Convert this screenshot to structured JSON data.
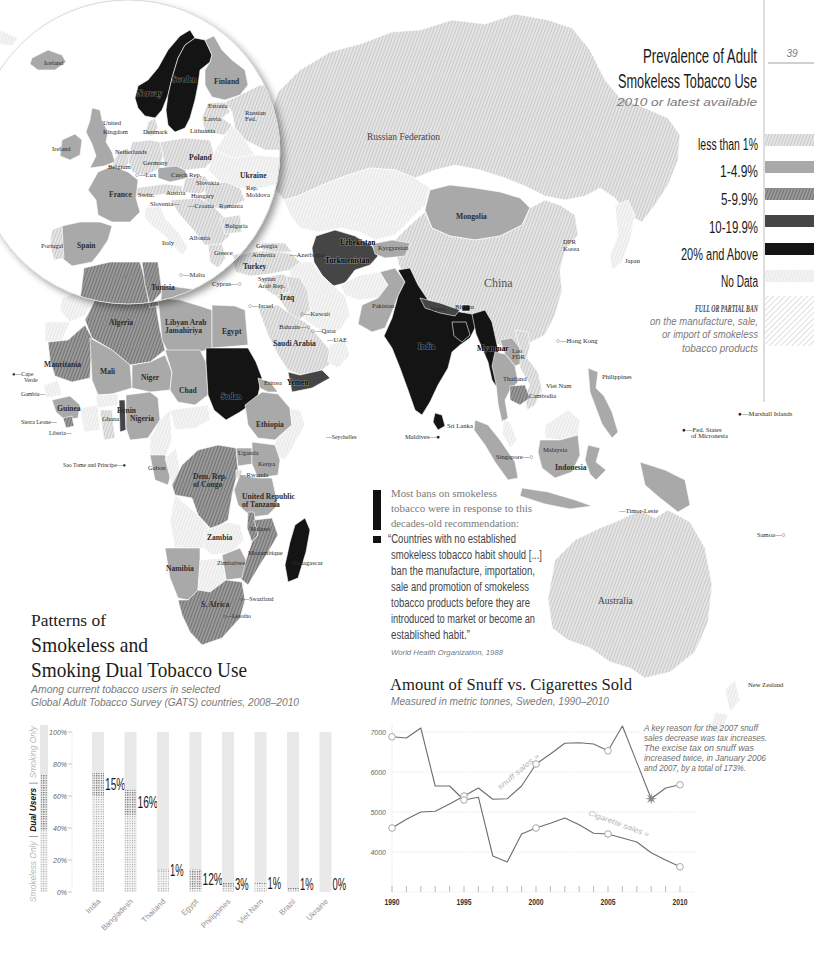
{
  "page": {
    "number": "39"
  },
  "map_title": {
    "line1": "Prevalence of Adult",
    "line2": "Smokeless Tobacco Use",
    "subtitle": "2010 or latest available"
  },
  "legend": {
    "items": [
      {
        "key": "lt1",
        "label": "less than 1%",
        "color": "#e2e2e2",
        "hatched": true
      },
      {
        "key": "1to5",
        "label": "1-4.9%",
        "color": "#a9a9a9",
        "hatched": false
      },
      {
        "key": "5to10",
        "label": "5-9.9%",
        "color": "#8c8c8c",
        "hatched": true
      },
      {
        "key": "10to20",
        "label": "10-19.9%",
        "color": "#454545",
        "hatched": false
      },
      {
        "key": "20plus",
        "label": "20% and Above",
        "color": "#141414",
        "hatched": false
      },
      {
        "key": "nodata",
        "label": "No Data",
        "color": "#f0f0f0",
        "hatched": true
      }
    ],
    "ban": {
      "title": "FULL OR PARTIAL BAN",
      "lines": [
        "on the manufacture, sale,",
        "or import of smokeless",
        "tobacco products"
      ]
    }
  },
  "map": {
    "countries": {
      "greenland": "nodata",
      "russia": "lt1",
      "kazakhstan": "nodata",
      "mongolia": "1to5",
      "china": "lt1",
      "japan": "nodata",
      "uzbekistan_turkmenistan": "10to20",
      "kyrgyzstan": "1to5",
      "afghanistan": "nodata",
      "iran": "nodata",
      "pakistan": "1to5",
      "india": "20plus",
      "nepal": "10to20",
      "bhutan": "20plus",
      "bangladesh": "20plus",
      "myanmar": "20plus",
      "lao_pdr": "1to5",
      "thailand": "1to5",
      "viet_nam": "lt1",
      "cambodia": "5to10",
      "malaysia_peninsula": "nodata",
      "sumatra": "1to5",
      "malaysia_borneo": "nodata",
      "kalimantan": "1to5",
      "java": "1to5",
      "sulawesi": "1to5",
      "papua": "1to5",
      "philippines": "1to5",
      "sri_lanka": "20plus",
      "turkey": "lt1",
      "caucasus": "lt1",
      "syria": "lt1",
      "iraq": "lt1",
      "saudi_arabia": "lt1",
      "yemen": "10to20",
      "oman": "nodata",
      "morocco": "nodata",
      "western_sahara": "nodata",
      "algeria": "5to10",
      "tunisia": "5to10",
      "libya": "1to5",
      "egypt": "1to5",
      "mauritania": "5to10",
      "mali": "1to5",
      "niger": "1to5",
      "chad": "1to5",
      "sudan": "20plus",
      "eritrea": "1to5",
      "ethiopia": "1to5",
      "somalia": "nodata",
      "senegal_gambia": "nodata",
      "guinea": "1to5",
      "sierra_leone": "5to10",
      "cote_divoire": "nodata",
      "ghana": "lt1",
      "benin": "10to20",
      "burkina_faso": "nodata",
      "nigeria": "1to5",
      "cameroon": "nodata",
      "central_african_rep": "nodata",
      "gabon": "1to5",
      "congo": "nodata",
      "dem_rep_congo": "5to10",
      "uganda": "1to5",
      "kenya": "1to5",
      "rwanda": "lt1",
      "tanzania": "1to5",
      "angola": "nodata",
      "zambia": "nodata",
      "malawi": "5to10",
      "mozambique": "5to10",
      "zimbabwe": "1to5",
      "namibia": "1to5",
      "botswana": "nodata",
      "south_africa": "5to10",
      "madagascar": "20plus",
      "australia": "lt1",
      "new_zealand": "nodata",
      "eu_iceland": "1to5",
      "eu_norway": "20plus",
      "eu_sweden": "20plus",
      "eu_finland": "1to5",
      "eu_baltics": "lt1",
      "eu_russia": "lt1",
      "eu_belarus": "nodata",
      "eu_uk": "1to5",
      "eu_ireland": "1to5",
      "eu_denmark": "lt1",
      "eu_benelux": "lt1",
      "eu_germany": "lt1",
      "eu_poland": "lt1",
      "eu_czech": "1to5",
      "eu_slovakia_hungary": "lt1",
      "eu_alps": "lt1",
      "eu_ukraine": "nodata",
      "eu_romania_moldova": "lt1",
      "eu_france": "1to5",
      "eu_spain": "1to5",
      "eu_portugal": "lt1",
      "eu_italy": "nodata",
      "eu_balkans": "lt1",
      "eu_greece": "lt1",
      "eu_bulgaria": "lt1",
      "eu_turkey": "lt1",
      "eu_algeria": "5to10",
      "eu_tunisia": "5to10",
      "eu_libya": "1to5"
    },
    "inset_labels": [
      {
        "t": "Iceland",
        "x": 44,
        "y": 65
      },
      {
        "t": "Sweden",
        "x": 172,
        "y": 82,
        "s": "dark"
      },
      {
        "t": "Norway",
        "x": 137,
        "y": 96,
        "s": "dark"
      },
      {
        "t": "Finland",
        "x": 214,
        "y": 84,
        "s": "md"
      },
      {
        "t": "Estonia",
        "x": 208,
        "y": 108
      },
      {
        "t": "Latvia",
        "x": 204,
        "y": 121
      },
      {
        "t": "Lithuania",
        "x": 190,
        "y": 133
      },
      {
        "t": "Russian",
        "x": 245,
        "y": 115
      },
      {
        "t": "Fed.",
        "x": 245,
        "y": 121
      },
      {
        "t": "United",
        "x": 103,
        "y": 125
      },
      {
        "t": "Kingdom",
        "x": 103,
        "y": 134
      },
      {
        "t": "Denmark",
        "x": 143,
        "y": 134
      },
      {
        "t": "Ireland",
        "x": 52,
        "y": 151
      },
      {
        "t": "Netherlands",
        "x": 115,
        "y": 154
      },
      {
        "t": "Germany",
        "x": 143,
        "y": 165
      },
      {
        "t": "Poland",
        "x": 189,
        "y": 160,
        "s": "md"
      },
      {
        "t": "Belgium",
        "x": 108,
        "y": 169
      },
      {
        "t": "○—Lux",
        "x": 135,
        "y": 177
      },
      {
        "t": "Czech Rep.",
        "x": 171,
        "y": 177
      },
      {
        "t": "Slovakia",
        "x": 196,
        "y": 185
      },
      {
        "t": "Ukraine",
        "x": 240,
        "y": 178,
        "s": "md"
      },
      {
        "t": "France",
        "x": 109,
        "y": 197,
        "s": "md"
      },
      {
        "t": "Switz.",
        "x": 138,
        "y": 197
      },
      {
        "t": "Austria",
        "x": 166,
        "y": 195
      },
      {
        "t": "Hungary",
        "x": 191,
        "y": 198
      },
      {
        "t": "Rep.",
        "x": 246,
        "y": 190
      },
      {
        "t": "Moldova",
        "x": 246,
        "y": 197
      },
      {
        "t": "Slovenia—",
        "x": 150,
        "y": 206
      },
      {
        "t": "—Croatia",
        "x": 188,
        "y": 208
      },
      {
        "t": "Romania",
        "x": 219,
        "y": 208
      },
      {
        "t": "Bulgaria",
        "x": 225,
        "y": 228
      },
      {
        "t": "Portugal",
        "x": 41,
        "y": 248
      },
      {
        "t": "Spain",
        "x": 77,
        "y": 248,
        "s": "md"
      },
      {
        "t": "Italy",
        "x": 162,
        "y": 245
      },
      {
        "t": "Albania",
        "x": 189,
        "y": 240
      },
      {
        "t": "Greece",
        "x": 214,
        "y": 255
      },
      {
        "t": "○—Malta",
        "x": 179,
        "y": 277
      },
      {
        "t": "Tunisia",
        "x": 151,
        "y": 290,
        "s": "md"
      }
    ],
    "labels": [
      {
        "t": "Russian Federation",
        "x": 367,
        "y": 140,
        "s": "lg"
      },
      {
        "t": "Mongolia",
        "x": 456,
        "y": 219,
        "s": "md"
      },
      {
        "t": "China",
        "x": 484,
        "y": 287,
        "s": "xl"
      },
      {
        "t": "DPR",
        "x": 563,
        "y": 244
      },
      {
        "t": "Korea",
        "x": 563,
        "y": 251
      },
      {
        "t": "Japan",
        "x": 625,
        "y": 263
      },
      {
        "t": "Georgia",
        "x": 256,
        "y": 248
      },
      {
        "t": "Armenia",
        "x": 252,
        "y": 257
      },
      {
        "t": "—Azerbaijan",
        "x": 290,
        "y": 257
      },
      {
        "t": "Uzbekistan",
        "x": 340,
        "y": 245,
        "s": "dark"
      },
      {
        "t": "Turkmenistan",
        "x": 325,
        "y": 263,
        "s": "dark"
      },
      {
        "t": "Kyrgyzstan",
        "x": 378,
        "y": 250
      },
      {
        "t": "Turkey",
        "x": 243,
        "y": 269,
        "s": "md"
      },
      {
        "t": "Cyprus—○",
        "x": 212,
        "y": 286
      },
      {
        "t": "Syrian",
        "x": 258,
        "y": 281
      },
      {
        "t": "Arab Rep.",
        "x": 258,
        "y": 288
      },
      {
        "t": "Iraq",
        "x": 280,
        "y": 300,
        "s": "md"
      },
      {
        "t": "○—Israel",
        "x": 248,
        "y": 308
      },
      {
        "t": "○—Kuwait",
        "x": 300,
        "y": 316
      },
      {
        "t": "Bahrain—○",
        "x": 279,
        "y": 329
      },
      {
        "t": "○—Qatar",
        "x": 311,
        "y": 333
      },
      {
        "t": "—UAE",
        "x": 327,
        "y": 342
      },
      {
        "t": "Saudi Arabia",
        "x": 273,
        "y": 346,
        "s": "md"
      },
      {
        "t": "Yemen",
        "x": 287,
        "y": 385,
        "s": "dark"
      },
      {
        "t": "Pakistan",
        "x": 372,
        "y": 308
      },
      {
        "t": "Nepal",
        "x": 430,
        "y": 311
      },
      {
        "t": "Bhutan",
        "x": 455,
        "y": 309
      },
      {
        "t": "India",
        "x": 418,
        "y": 349,
        "s": "dark"
      },
      {
        "t": "Myanmar",
        "x": 477,
        "y": 351,
        "s": "dark"
      },
      {
        "t": "Lao",
        "x": 512,
        "y": 353
      },
      {
        "t": "PDR",
        "x": 512,
        "y": 359
      },
      {
        "t": "Thailand",
        "x": 503,
        "y": 381
      },
      {
        "t": "Viet Nam",
        "x": 546,
        "y": 388
      },
      {
        "t": "Cambodia",
        "x": 529,
        "y": 398
      },
      {
        "t": "○—Hong Kong",
        "x": 556,
        "y": 343
      },
      {
        "t": "Philippines",
        "x": 602,
        "y": 379
      },
      {
        "t": "●—Marshall Islands",
        "x": 738,
        "y": 416
      },
      {
        "t": "●—Fed. States",
        "x": 682,
        "y": 432
      },
      {
        "t": "of Micronesia",
        "x": 691,
        "y": 438
      },
      {
        "t": "Sri Lanka",
        "x": 447,
        "y": 428
      },
      {
        "t": "Maldives—●",
        "x": 405,
        "y": 439
      },
      {
        "t": "Singapore—○",
        "x": 496,
        "y": 459
      },
      {
        "t": "Malaysia",
        "x": 543,
        "y": 452
      },
      {
        "t": "Indonesia",
        "x": 555,
        "y": 470,
        "s": "md"
      },
      {
        "t": "—Timor-Leste",
        "x": 619,
        "y": 513
      },
      {
        "t": "Samoa—○",
        "x": 757,
        "y": 537
      },
      {
        "t": "Australia",
        "x": 598,
        "y": 604,
        "s": "lg"
      },
      {
        "t": "New Zealand",
        "x": 748,
        "y": 687
      },
      {
        "t": "Algeria",
        "x": 109,
        "y": 325,
        "s": "md"
      },
      {
        "t": "Libyan Arab",
        "x": 165,
        "y": 325,
        "s": "md"
      },
      {
        "t": "Jamahiriya",
        "x": 165,
        "y": 333,
        "s": "md"
      },
      {
        "t": "Egypt",
        "x": 222,
        "y": 334,
        "s": "md"
      },
      {
        "t": "Mauritania",
        "x": 44,
        "y": 367,
        "s": "md"
      },
      {
        "t": "Mali",
        "x": 100,
        "y": 374,
        "s": "md"
      },
      {
        "t": "Niger",
        "x": 141,
        "y": 380,
        "s": "md"
      },
      {
        "t": "●—Cape",
        "x": 12,
        "y": 376,
        "s": "xs"
      },
      {
        "t": "Verde",
        "x": 24,
        "y": 382,
        "s": "xs"
      },
      {
        "t": "Chad",
        "x": 179,
        "y": 393,
        "s": "md"
      },
      {
        "t": "Sudan",
        "x": 221,
        "y": 399,
        "s": "dark"
      },
      {
        "t": "Eritrea",
        "x": 264,
        "y": 385
      },
      {
        "t": "Gambia—",
        "x": 21,
        "y": 396,
        "s": "xs"
      },
      {
        "t": "Guinea",
        "x": 57,
        "y": 411,
        "s": "md"
      },
      {
        "t": "Benin",
        "x": 117,
        "y": 413,
        "s": "md"
      },
      {
        "t": "Ghana",
        "x": 102,
        "y": 421
      },
      {
        "t": "Nigeria",
        "x": 130,
        "y": 421,
        "s": "md"
      },
      {
        "t": "Ethiopia",
        "x": 256,
        "y": 427,
        "s": "md"
      },
      {
        "t": "Sierra Leone—",
        "x": 21,
        "y": 424,
        "s": "xs"
      },
      {
        "t": "Liberia—",
        "x": 49,
        "y": 435,
        "s": "xs"
      },
      {
        "t": "Sao Tome and Principe—●",
        "x": 63,
        "y": 467,
        "s": "xs"
      },
      {
        "t": "Gabon",
        "x": 148,
        "y": 470
      },
      {
        "t": "Uganda",
        "x": 238,
        "y": 455
      },
      {
        "t": "Kenya",
        "x": 258,
        "y": 466
      },
      {
        "t": "—Rwanda",
        "x": 240,
        "y": 477
      },
      {
        "t": "Dem. Rep.",
        "x": 193,
        "y": 479,
        "s": "md"
      },
      {
        "t": "of Congo",
        "x": 193,
        "y": 487,
        "s": "md"
      },
      {
        "t": "United Republic",
        "x": 242,
        "y": 499,
        "s": "md"
      },
      {
        "t": "of Tanzania",
        "x": 242,
        "y": 507,
        "s": "md"
      },
      {
        "t": "—Seychelles",
        "x": 326,
        "y": 439,
        "s": "xs"
      },
      {
        "t": "Malawi",
        "x": 250,
        "y": 531
      },
      {
        "t": "Zambia",
        "x": 207,
        "y": 540,
        "s": "md"
      },
      {
        "t": "Mozambique",
        "x": 248,
        "y": 555
      },
      {
        "t": "Zimbabwe",
        "x": 217,
        "y": 565
      },
      {
        "t": "Madagascar",
        "x": 291,
        "y": 565
      },
      {
        "t": "Namibia",
        "x": 166,
        "y": 571,
        "s": "md"
      },
      {
        "t": "○—Swaziland",
        "x": 240,
        "y": 601,
        "s": "xs"
      },
      {
        "t": "S. Africa",
        "x": 201,
        "y": 607,
        "s": "md"
      },
      {
        "t": "○—Lesotho",
        "x": 223,
        "y": 618,
        "s": "xs"
      }
    ]
  },
  "quote": {
    "intro": [
      "Most bans on smokeless",
      "tobacco were in response to this",
      "decades-old recommendation:"
    ],
    "body": [
      "“Countries with no established",
      "smokeless tobacco habit should [...]",
      "ban the manufacture, importation,",
      "sale and promotion of smokeless",
      "tobacco products before they are",
      "introduced to market or become an",
      "established habit.”"
    ],
    "source": "World Health Organization, 1988"
  },
  "dual_use": {
    "title_line1": "Patterns of",
    "title_line2": "Smokeless and",
    "title_line3": "Smoking Dual Tobacco Use",
    "subtitle_line1": "Among current tobacco users in selected",
    "subtitle_line2": "Global Adult Tobacco Survey (GATS) countries, 2008–2010",
    "legend": {
      "smokeless_only": "Smokeless Only",
      "separator": "|",
      "dual_users": "Dual Users",
      "smoking_only": "Smoking Only"
    },
    "y_ticks": [
      "100%",
      "80%",
      "60%",
      "40%",
      "20%",
      "0%"
    ]
  },
  "snuff_chart": {
    "title": "Amount of Snuff vs. Cigarettes Sold",
    "subtitle": "Measured in metric tonnes, Sweden, 1990–2010",
    "annotation": [
      "A key reason for the 2007 snuff",
      "sales decrease was tax increases.",
      "The excise tax on snuff was",
      "increased twice, in January 2006",
      "and 2007, by a total of 173%."
    ],
    "y_ticks": [
      "7000",
      "6000",
      "5000",
      "4000"
    ],
    "x_ticks": [
      "1990",
      "1995",
      "2000",
      "2005",
      "2010"
    ],
    "series_labels": [
      "snuff sales »",
      "Cigarette sales »"
    ]
  },
  "chart_data": [
    {
      "type": "bar",
      "title": "Patterns of Smokeless and Smoking Dual Tobacco Use",
      "subtitle": "Among current tobacco users in selected Global Adult Tobacco Survey (GATS) countries, 2008–2010",
      "stacked": true,
      "categories": [
        "India",
        "Bangladesh",
        "Thailand",
        "Egypt",
        "Philippines",
        "Viet Nam",
        "Brazil",
        "Ukraine"
      ],
      "series": [
        {
          "name": "Smokeless Only",
          "values": [
            60,
            48,
            13,
            2,
            3,
            5,
            1.5,
            0
          ]
        },
        {
          "name": "Dual Users",
          "values": [
            15,
            16,
            1,
            12,
            3,
            1,
            1,
            0
          ]
        },
        {
          "name": "Smoking Only",
          "values": [
            25,
            36,
            86,
            86,
            94,
            94,
            97.5,
            100
          ]
        }
      ],
      "data_labels": [
        "15%",
        "16%",
        "1%",
        "12%",
        "3%",
        "1%",
        "1%",
        "0%"
      ],
      "xlabel": "",
      "ylabel": "",
      "ylim": [
        0,
        100
      ],
      "yticks": [
        "0%",
        "20%",
        "40%",
        "60%",
        "80%",
        "100%"
      ],
      "legend_position": "left-vertical"
    },
    {
      "type": "line",
      "title": "Amount of Snuff vs. Cigarettes Sold",
      "subtitle": "Measured in metric tonnes, Sweden, 1990–2010",
      "x": [
        1990,
        1991,
        1992,
        1993,
        1994,
        1995,
        1996,
        1997,
        1998,
        1999,
        2000,
        2001,
        2002,
        2003,
        2004,
        2005,
        2006,
        2007,
        2008,
        2009,
        2010
      ],
      "series": [
        {
          "name": "snuff sales",
          "values": [
            4600,
            4820,
            5000,
            5020,
            5200,
            5400,
            5600,
            5320,
            5330,
            5650,
            6200,
            6450,
            6720,
            6730,
            6700,
            6530,
            7150,
            6240,
            5330,
            5600,
            5680
          ]
        },
        {
          "name": "Cigarette sales",
          "values": [
            6880,
            6850,
            7100,
            5650,
            5650,
            5300,
            5370,
            3900,
            3750,
            4450,
            4600,
            4720,
            4850,
            4680,
            4470,
            4450,
            4350,
            4250,
            3980,
            3800,
            3630
          ]
        }
      ],
      "ylim": [
        3000,
        7200
      ],
      "yticks": [
        4000,
        5000,
        6000,
        7000
      ],
      "xticks": [
        1990,
        1995,
        2000,
        2005,
        2010
      ],
      "grid": true,
      "markers": "circles every 5 years; star at 2008 on snuff series",
      "annotation": "A key reason for the 2007 snuff sales decrease was tax increases. The excise tax on snuff was increased twice, in January 2006 and 2007, by a total of 173%."
    }
  ]
}
